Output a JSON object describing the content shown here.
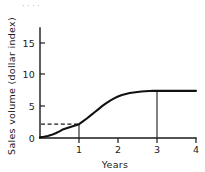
{
  "figure": {
    "background_color": "#ffffff",
    "ink_color": "#1a1a1a",
    "top_cropped_caption": "· · · ·"
  },
  "chart_data": {
    "type": "line",
    "title": "",
    "xlabel": "Years",
    "ylabel": "Sales volume (dollar index)",
    "xlim": [
      0,
      4
    ],
    "ylim": [
      0,
      17.5
    ],
    "xticks": [
      0,
      1,
      2,
      3,
      4
    ],
    "xtick_labels": [
      "0",
      "1",
      "2",
      "3",
      "4"
    ],
    "yticks": [
      0,
      5,
      10,
      15
    ],
    "ytick_labels": [
      "0",
      "5",
      "10",
      "15"
    ],
    "grid": false,
    "legend": false,
    "legend_position": "none",
    "series": [
      {
        "name": "Sales volume",
        "style": "solid",
        "color": "#111111",
        "x": [
          0.0,
          0.1,
          0.2,
          0.3,
          0.4,
          0.5,
          0.6,
          0.7,
          0.8,
          0.9,
          1.0,
          1.1,
          1.2,
          1.3,
          1.4,
          1.5,
          1.6,
          1.7,
          1.8,
          1.9,
          2.0,
          2.1,
          2.2,
          2.3,
          2.4,
          2.5,
          2.6,
          2.7,
          2.8,
          2.9,
          3.0,
          3.1,
          3.2,
          3.3,
          3.4,
          3.5,
          3.6,
          3.7,
          3.8,
          3.9,
          4.0
        ],
        "y": [
          0.12,
          0.2,
          0.32,
          0.5,
          0.75,
          1.05,
          1.4,
          1.6,
          1.8,
          2.0,
          2.2,
          2.65,
          3.1,
          3.6,
          4.1,
          4.6,
          5.1,
          5.55,
          5.95,
          6.3,
          6.6,
          6.85,
          7.0,
          7.15,
          7.25,
          7.33,
          7.4,
          7.44,
          7.47,
          7.49,
          7.5,
          7.5,
          7.5,
          7.5,
          7.5,
          7.5,
          7.5,
          7.5,
          7.5,
          7.5,
          7.5
        ]
      }
    ],
    "annotations": [
      {
        "name": "reference-at-year-1",
        "style": "dashed",
        "description": "Dashed horizontal line from y-axis to curve at x=1, then vertical drop to x-axis",
        "x": 1,
        "y": 2.2
      },
      {
        "name": "reference-at-year-3",
        "style": "solid",
        "description": "Vertical line from curve at x=3 down to x-axis",
        "x": 3,
        "y": 7.5
      }
    ]
  }
}
